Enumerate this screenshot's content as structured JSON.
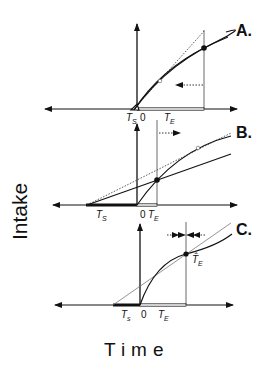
{
  "axes": {
    "ylabel": "Intake",
    "xlabel": "Time"
  },
  "panels": [
    {
      "letter": "A.",
      "ts_label": "T",
      "ts_sub": "S",
      "zero": "0",
      "te_label": "T",
      "te_sub": "E",
      "shift": "left"
    },
    {
      "letter": "B.",
      "ts_label": "T",
      "ts_sub": "S",
      "zero": "0",
      "te_label": "T",
      "te_sub": "E",
      "shift": "right"
    },
    {
      "letter": "C.",
      "ts_label": "T",
      "ts_sub": "s",
      "zero": "0",
      "te_label": "T",
      "te_sub": "E",
      "optimum_label": "T̂",
      "optimum_sub": "E",
      "shift": "stable"
    }
  ],
  "colors": {
    "ink": "#111111",
    "thin": "#444444",
    "bar_fill": "#cfcfcf"
  }
}
